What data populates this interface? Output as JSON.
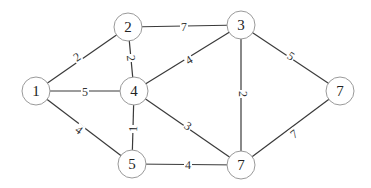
{
  "graph": {
    "type": "weighted-undirected-graph",
    "nodes": [
      {
        "id": "n1",
        "label": "1",
        "x": 36,
        "y": 91
      },
      {
        "id": "n2",
        "label": "2",
        "x": 128,
        "y": 27
      },
      {
        "id": "n3",
        "label": "3",
        "x": 241,
        "y": 25
      },
      {
        "id": "n4",
        "label": "4",
        "x": 134,
        "y": 91
      },
      {
        "id": "n5",
        "label": "5",
        "x": 132,
        "y": 164
      },
      {
        "id": "n7b",
        "label": "7",
        "x": 241,
        "y": 165
      },
      {
        "id": "n7r",
        "label": "7",
        "x": 340,
        "y": 91
      }
    ],
    "edges": [
      {
        "from": "n1",
        "to": "n2",
        "weight": "2",
        "lx": 77,
        "ly": 57
      },
      {
        "from": "n2",
        "to": "n3",
        "weight": "7",
        "lx": 184,
        "ly": 27
      },
      {
        "from": "n2",
        "to": "n4",
        "weight": "2",
        "lx": 131,
        "ly": 58
      },
      {
        "from": "n1",
        "to": "n4",
        "weight": "5",
        "lx": 85,
        "ly": 92
      },
      {
        "from": "n4",
        "to": "n3",
        "weight": "4",
        "lx": 189,
        "ly": 60
      },
      {
        "from": "n3",
        "to": "n7b",
        "weight": "2",
        "lx": 243,
        "ly": 94
      },
      {
        "from": "n3",
        "to": "n7r",
        "weight": "5",
        "lx": 291,
        "ly": 56
      },
      {
        "from": "n4",
        "to": "n5",
        "weight": "1",
        "lx": 133,
        "ly": 129
      },
      {
        "from": "n1",
        "to": "n5",
        "weight": "4",
        "lx": 79,
        "ly": 130
      },
      {
        "from": "n4",
        "to": "n7b",
        "weight": "3",
        "lx": 188,
        "ly": 126
      },
      {
        "from": "n5",
        "to": "n7b",
        "weight": "4",
        "lx": 188,
        "ly": 165
      },
      {
        "from": "n7b",
        "to": "n7r",
        "weight": "7",
        "lx": 294,
        "ly": 134
      }
    ],
    "node_radius": 14,
    "colors": {
      "edge": "#3a3a3a",
      "node_stroke": "#9a9a9a",
      "text": "#222222"
    }
  }
}
